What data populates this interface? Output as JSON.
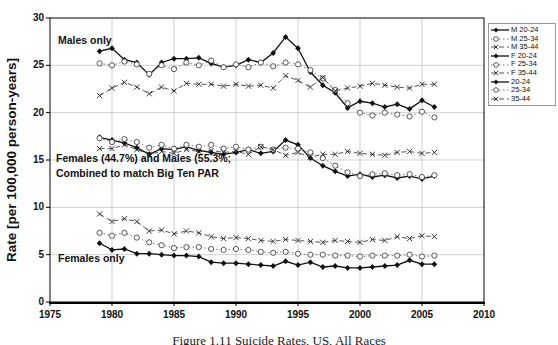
{
  "figure": {
    "y_axis_title": "Rate [per 100,000 person-years]",
    "caption": "Figure 1.11 Suicide Rates, US, All Races",
    "annotations": {
      "males_only": "Males only",
      "combined_line1": "Females (44.7%) and Males (55.3%;",
      "combined_line2": "Combined to match Big Ten PAR",
      "females_only": "Females only"
    },
    "colors": {
      "solid_line": "#111111",
      "dotted_line": "#777777",
      "dashed_line": "#555555",
      "grid": "#bcbcbc",
      "axis": "#000000",
      "marker_open_fill": "#ffffff"
    }
  },
  "chart_data": {
    "type": "line",
    "title": "",
    "xlabel": "",
    "ylabel": "Rate [per 100,000 person-years]",
    "xlim": [
      1975,
      2010
    ],
    "ylim": [
      0,
      30
    ],
    "x_ticks": [
      1975,
      1980,
      1985,
      1990,
      1995,
      2000,
      2005,
      2010
    ],
    "y_ticks": [
      0,
      5,
      10,
      15,
      20,
      25,
      30
    ],
    "grid": true,
    "legend_position": "outside-top-right",
    "x": [
      1979,
      1980,
      1981,
      1982,
      1983,
      1984,
      1985,
      1986,
      1987,
      1988,
      1989,
      1990,
      1991,
      1992,
      1993,
      1994,
      1995,
      1996,
      1997,
      1998,
      1999,
      2000,
      2001,
      2002,
      2003,
      2004,
      2005,
      2006
    ],
    "series": [
      {
        "name": "M 20-24",
        "marker": "diamond-filled",
        "line": "solid",
        "values": [
          26.5,
          26.8,
          25.6,
          25.3,
          24.0,
          25.3,
          25.7,
          25.7,
          25.8,
          25.2,
          24.8,
          25.0,
          25.6,
          25.3,
          26.3,
          28.0,
          26.8,
          24.3,
          22.9,
          22.1,
          20.5,
          21.2,
          21.0,
          20.6,
          20.9,
          20.4,
          21.3,
          20.6
        ]
      },
      {
        "name": "M 25-34",
        "marker": "circle-open",
        "line": "dotted",
        "values": [
          25.2,
          25.0,
          25.4,
          25.1,
          24.1,
          25.0,
          24.6,
          25.3,
          25.0,
          25.5,
          24.8,
          25.1,
          24.8,
          25.3,
          24.9,
          25.3,
          25.1,
          24.5,
          23.6,
          22.4,
          21.0,
          20.0,
          19.7,
          20.0,
          19.8,
          19.6,
          20.1,
          19.5
        ]
      },
      {
        "name": "M 35-44",
        "marker": "x",
        "line": "dashed",
        "values": [
          21.8,
          22.6,
          23.2,
          22.7,
          22.0,
          22.7,
          22.3,
          23.1,
          23.0,
          23.0,
          22.8,
          23.0,
          22.8,
          22.9,
          22.6,
          23.9,
          23.4,
          22.7,
          23.7,
          22.3,
          22.6,
          22.8,
          23.1,
          22.9,
          22.7,
          22.6,
          23.0,
          23.0
        ]
      },
      {
        "name": "F 20-24",
        "marker": "diamond-filled",
        "line": "solid",
        "values": [
          6.2,
          5.5,
          5.6,
          5.1,
          5.1,
          5.0,
          4.9,
          4.9,
          4.8,
          4.2,
          4.1,
          4.1,
          4.0,
          3.9,
          3.8,
          4.3,
          3.9,
          4.2,
          3.7,
          3.8,
          3.6,
          3.6,
          3.7,
          3.8,
          3.9,
          4.4,
          4.0,
          4.0
        ]
      },
      {
        "name": "F 25-34",
        "marker": "circle-open",
        "line": "dotted",
        "values": [
          7.3,
          7.0,
          7.3,
          6.8,
          6.3,
          6.0,
          5.7,
          5.8,
          5.8,
          5.6,
          5.5,
          5.6,
          5.5,
          5.3,
          5.2,
          5.3,
          5.1,
          5.0,
          5.0,
          4.9,
          4.9,
          4.8,
          4.9,
          4.9,
          4.9,
          5.0,
          4.8,
          4.9
        ]
      },
      {
        "name": "F 35-44",
        "marker": "x",
        "line": "dashed",
        "values": [
          9.3,
          8.5,
          8.8,
          8.5,
          7.5,
          7.6,
          7.2,
          7.5,
          7.3,
          6.9,
          6.7,
          6.8,
          6.7,
          6.5,
          6.4,
          6.6,
          6.5,
          6.4,
          6.3,
          6.5,
          6.4,
          6.3,
          6.6,
          6.5,
          6.9,
          6.7,
          7.0,
          6.9
        ]
      },
      {
        "name": "20-24",
        "marker": "diamond-filled",
        "line": "solid",
        "values": [
          17.4,
          17.1,
          16.8,
          16.3,
          15.6,
          16.2,
          16.1,
          16.4,
          16.0,
          15.8,
          15.6,
          15.8,
          16.1,
          15.7,
          15.9,
          17.1,
          16.6,
          15.2,
          14.4,
          13.8,
          13.3,
          13.5,
          13.2,
          13.4,
          13.1,
          13.3,
          13.0,
          13.3
        ]
      },
      {
        "name": "25-34",
        "marker": "circle-open",
        "line": "dotted",
        "values": [
          17.3,
          16.9,
          17.2,
          16.9,
          16.3,
          16.6,
          16.2,
          16.6,
          16.4,
          16.6,
          16.2,
          16.4,
          16.1,
          16.4,
          16.1,
          16.3,
          16.2,
          15.8,
          15.2,
          14.4,
          13.7,
          13.3,
          13.5,
          13.6,
          13.4,
          13.5,
          13.2,
          13.4
        ]
      },
      {
        "name": "35-44",
        "marker": "x",
        "line": "dashed",
        "values": [
          16.2,
          16.2,
          16.6,
          16.1,
          15.6,
          15.9,
          15.7,
          16.1,
          15.9,
          16.0,
          15.8,
          15.9,
          15.6,
          16.4,
          16.1,
          15.5,
          15.8,
          15.3,
          15.6,
          15.6,
          15.9,
          15.7,
          15.6,
          15.5,
          15.8,
          15.9,
          15.7,
          15.8
        ]
      }
    ]
  }
}
